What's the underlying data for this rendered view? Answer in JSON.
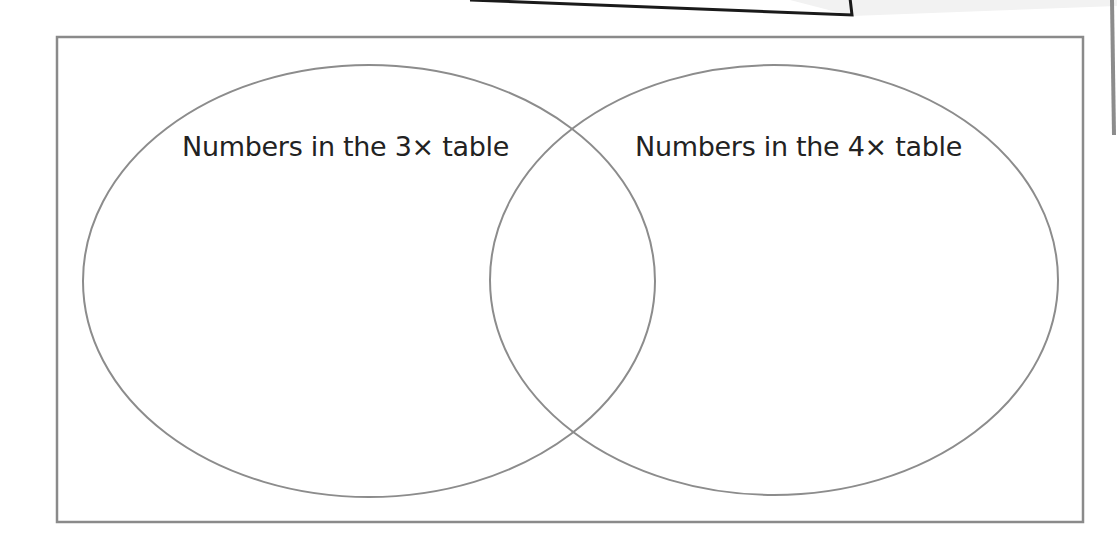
{
  "diagram": {
    "type": "venn",
    "sets": [
      {
        "id": "three-times-table",
        "label": "Numbers in the 3× table",
        "members": []
      },
      {
        "id": "four-times-table",
        "label": "Numbers in the 4× table",
        "members": []
      }
    ],
    "intersection": {
      "members": []
    },
    "colors": {
      "outline": "#8c8c8c",
      "frame": "#8a8a8a",
      "text": "#222222",
      "top_shape_fill": "#f2f2f2",
      "top_shape_stroke": "#1a1a1a",
      "background": "#ffffff"
    }
  }
}
